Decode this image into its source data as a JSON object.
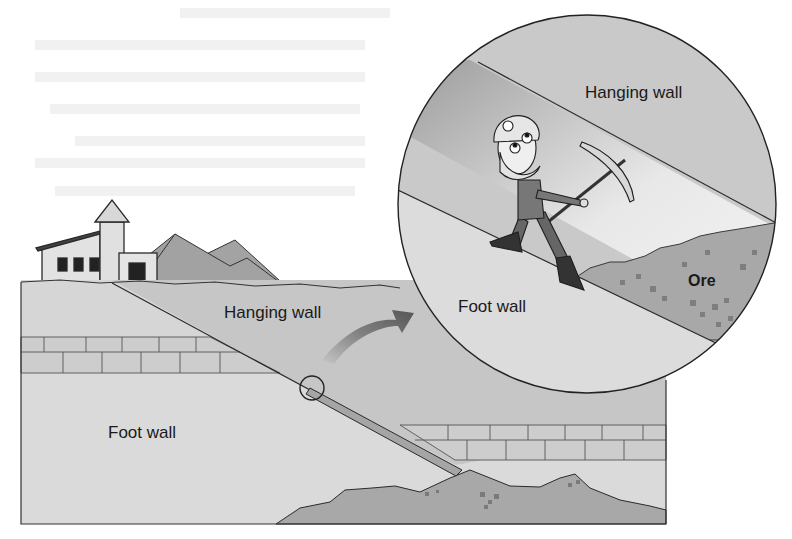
{
  "figure": {
    "labels": {
      "hanging_wall_main": "Hanging wall",
      "foot_wall_main": "Foot wall",
      "hanging_wall_inset": "Hanging wall",
      "foot_wall_inset": "Foot wall",
      "ore_inset": "Ore"
    },
    "colors": {
      "background": "#ffffff",
      "hanging_wall": "#c6c6c6",
      "foot_wall": "#dadada",
      "brick_layer": "#cfcfcf",
      "ore_body": "#a8a8a8",
      "mountain": "#a0a0a0",
      "arrow": "#6e6e6e",
      "outline": "#2a2a2a"
    },
    "elements": [
      "mine-building",
      "spoil-heaps",
      "fault-vein-line",
      "magnifier-circle",
      "zoom-arrow",
      "inset-circle",
      "miner-with-pickaxe"
    ]
  }
}
